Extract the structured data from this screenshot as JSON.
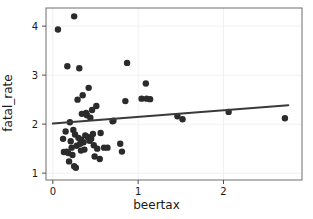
{
  "chart_data": {
    "type": "scatter",
    "title": "",
    "xlabel": "beertax",
    "ylabel": "fatal_rate",
    "xlim": [
      -0.08,
      2.92
    ],
    "ylim": [
      0.86,
      4.37
    ],
    "xticks": [
      0,
      1,
      2
    ],
    "xticklabels": [
      "0",
      "1",
      "2"
    ],
    "yticks": [
      1,
      2,
      3,
      4
    ],
    "yticklabels": [
      "1",
      "2",
      "3",
      "4"
    ],
    "grid": true,
    "grid_color": "#f0f0f0",
    "point_color": "#2b2b2b",
    "point_size": 3.2,
    "panel_background": "#ffffff",
    "panel_border_color": "#6e6e6e",
    "legend": null,
    "series": [
      {
        "name": "states",
        "x": [
          0.06,
          0.25,
          0.17,
          0.31,
          0.87,
          0.42,
          1.09,
          0.35,
          1.04,
          0.85,
          0.29,
          0.2,
          0.39,
          1.14,
          0.46,
          0.51,
          0.4,
          0.34,
          0.44,
          0.71,
          0.24,
          0.26,
          0.47,
          0.16,
          0.3,
          0.33,
          1.46,
          1.52,
          2.06,
          2.72,
          0.13,
          0.22,
          0.36,
          0.41,
          0.28,
          0.32,
          0.37,
          0.45,
          0.56,
          0.19,
          0.27,
          0.23,
          0.38,
          0.43,
          0.48,
          0.52,
          0.79,
          0.81,
          0.64,
          0.21,
          0.15,
          0.18,
          0.49,
          0.55,
          0.6,
          0.12,
          0.25,
          0.33,
          0.7,
          1.1
        ],
        "y": [
          3.93,
          4.2,
          3.18,
          3.14,
          3.25,
          2.74,
          2.83,
          2.59,
          2.52,
          2.47,
          2.5,
          2.04,
          2.23,
          2.51,
          2.29,
          2.37,
          2.18,
          2.21,
          2.13,
          2.07,
          1.88,
          1.79,
          1.8,
          1.44,
          1.72,
          1.68,
          2.16,
          2.1,
          2.25,
          2.12,
          1.43,
          1.52,
          1.63,
          1.74,
          1.56,
          1.6,
          1.48,
          1.7,
          1.82,
          1.24,
          1.11,
          1.37,
          1.77,
          1.66,
          1.57,
          1.5,
          1.6,
          1.44,
          1.52,
          1.65,
          1.85,
          1.41,
          1.34,
          1.29,
          1.52,
          1.7,
          1.14,
          1.46,
          2.06,
          2.52
        ]
      }
    ],
    "fit_line": {
      "type": "linear",
      "color": "#3a3a3a",
      "width": 2,
      "intercept": 2.012,
      "slope": 0.136,
      "x_start": 0.0,
      "x_end": 2.76,
      "y_start": 2.012,
      "y_end": 2.387
    }
  }
}
